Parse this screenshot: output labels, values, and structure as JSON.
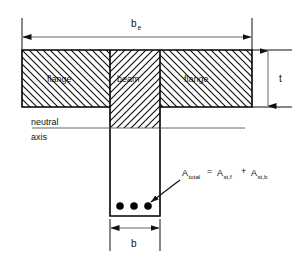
{
  "diagram": {
    "geometry": {
      "canvas_width": 303,
      "canvas_height": 257,
      "flange_left": 22,
      "flange_right": 252,
      "flange_top": 50,
      "flange_bottom": 107,
      "web_left": 110,
      "web_right": 160,
      "web_bottom": 216,
      "neutral_axis_y": 128,
      "neutral_axis_left": 32,
      "neutral_axis_right": 245
    },
    "colors": {
      "outline": "#000000",
      "hatch": "#111111",
      "text": "#111111",
      "thin_rule": "#555555",
      "background": "#ffffff",
      "rebar": "#000000"
    },
    "region_labels": {
      "flange_left": "flange",
      "beam": "beam",
      "flange_right": "flange"
    },
    "dimensions": {
      "effective_width": {
        "symbol": "b",
        "subscript": "e"
      },
      "flange_thickness": {
        "symbol": "t",
        "subscript": ""
      },
      "web_width": {
        "symbol": "b",
        "subscript": ""
      }
    },
    "neutral_axis": {
      "line1": "neutral",
      "line2": "axis"
    },
    "annotation": {
      "lhs_symbol": "A",
      "lhs_sub": "total",
      "equals": "=",
      "term1_symbol": "A",
      "term1_sub": "st,f",
      "plus": "+",
      "term2_symbol": "A",
      "term2_sub": "st,b"
    },
    "reinforcement": {
      "count": 3,
      "bars": [
        {
          "cx": 120,
          "cy": 206,
          "r": 3.6
        },
        {
          "cx": 134,
          "cy": 206,
          "r": 3.6
        },
        {
          "cx": 148,
          "cy": 206,
          "r": 3.6
        }
      ]
    }
  }
}
